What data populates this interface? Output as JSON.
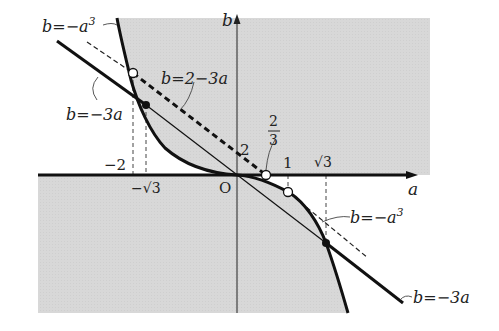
{
  "figure": {
    "colors": {
      "shade": "#d9d9d9",
      "ink": "#1a1a1a",
      "background": "#ffffff"
    },
    "axes": {
      "x_label": "a",
      "y_label": "b",
      "origin_label": "O"
    },
    "ticks": {
      "x_minus_2": "−2",
      "x_minus_sqrt3": "−√3",
      "x_1": "1",
      "x_sqrt3": "√3",
      "y_2": "2",
      "frac_num": "2",
      "frac_den": "3"
    },
    "curve_labels": {
      "cubic_top": "b=−a",
      "cubic_top_exp": "3",
      "cubic_right": "b=−a",
      "cubic_right_exp": "3",
      "line_2_minus_3a": "b=2−3a",
      "line_minus_3a_left": "b=−3a",
      "line_minus_3a_right": "b=−3a"
    },
    "points": [
      {
        "name": "(-2, 8)",
        "style": "open"
      },
      {
        "name": "(-√3, 3√3)",
        "style": "filled"
      },
      {
        "name": "(2/3, 0)",
        "style": "open"
      },
      {
        "name": "(1, -1)",
        "style": "open"
      },
      {
        "name": "(√3, -3√3)",
        "style": "filled"
      }
    ]
  }
}
